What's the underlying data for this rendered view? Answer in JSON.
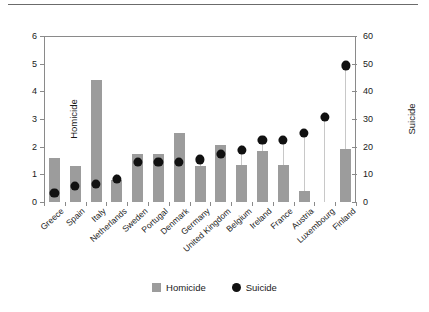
{
  "chart_data": {
    "type": "bar",
    "title": "",
    "subtitle": "",
    "categories": [
      "Greece",
      "Spain",
      "Italy",
      "Netherlands",
      "Sweden",
      "Portugal",
      "Denmark",
      "Germany",
      "United Kingdom",
      "Belgium",
      "Ireland",
      "France",
      "Austria",
      "Luxembourg",
      "Finland"
    ],
    "series": [
      {
        "name": "Homicide",
        "axis": "left",
        "type": "bar",
        "color": "#9c9c9c",
        "values": [
          1.6,
          1.3,
          4.4,
          0.8,
          1.75,
          1.75,
          2.5,
          1.3,
          2.05,
          1.35,
          1.85,
          1.35,
          0.4,
          0,
          1.9
        ]
      },
      {
        "name": "Suicide",
        "axis": "right",
        "type": "scatter",
        "color": "#111111",
        "values": [
          5,
          7.5,
          8,
          10,
          16,
          16,
          16,
          17,
          19,
          20.5,
          24,
          24,
          26.5,
          32.5,
          51
        ]
      }
    ],
    "xlabel": "",
    "ylabel": "Homicide",
    "y2label": "Suicide",
    "ylim": [
      0,
      6
    ],
    "y2lim": [
      0,
      60
    ],
    "yticks": [
      "0",
      "1",
      "2",
      "3",
      "4",
      "5",
      "6"
    ],
    "y2ticks": [
      "0",
      "10",
      "20",
      "30",
      "40",
      "50",
      "60"
    ],
    "grid": false,
    "legend_position": "bottom-center",
    "legend": [
      "Homicide",
      "Suicide"
    ]
  },
  "axes": {
    "left": {
      "title": "Homicide",
      "ticks": [
        "0",
        "1",
        "2",
        "3",
        "4",
        "5",
        "6"
      ]
    },
    "right": {
      "title": "Suicide",
      "ticks": [
        "0",
        "10",
        "20",
        "30",
        "40",
        "50",
        "60"
      ]
    }
  },
  "legend": {
    "items": [
      {
        "label": "Homicide",
        "marker": "square-swatch-icon"
      },
      {
        "label": "Suicide",
        "marker": "circle-marker-icon"
      }
    ]
  }
}
